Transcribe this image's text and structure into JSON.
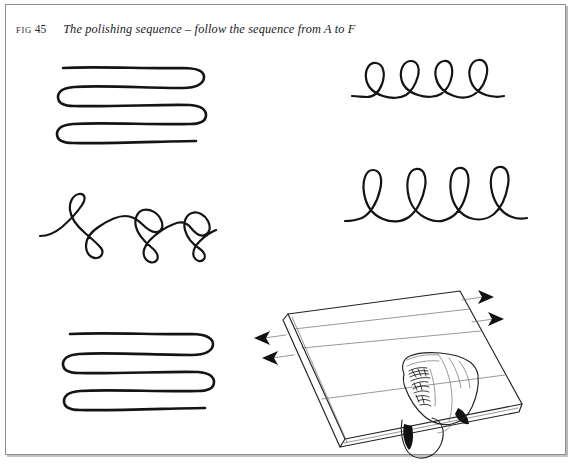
{
  "page": {
    "figure_number_prefix": "FIG",
    "figure_number": "45",
    "caption": "The polishing sequence – follow the sequence from A to F",
    "background_color": "#ffffff",
    "ink_color": "#141414",
    "frame_color": "#8e8e8e"
  },
  "figure": {
    "title": "The polishing sequence",
    "instruction": "follow the sequence from A to F",
    "sequence_start_label": "A",
    "sequence_end_label": "F",
    "panel_count": 6,
    "panels": [
      {
        "id": "A",
        "name": "serpentine-stroke-top-left",
        "pattern": "serpentine",
        "description": "Horizontal back-and-forth serpentine stroke with rounded U-turns",
        "rows": 4,
        "position": "top-left"
      },
      {
        "id": "B",
        "name": "small-loop-stroke-top-right",
        "pattern": "loops",
        "description": "Row of small overlapping loops riding on a horizontal baseline",
        "loop_count": 4,
        "position": "top-right"
      },
      {
        "id": "C",
        "name": "figure-eight-stroke-middle-left",
        "pattern": "figure-eight",
        "description": "Alternating loops above and below a wavy line forming figure eights",
        "loop_count": 6,
        "position": "middle-left"
      },
      {
        "id": "D",
        "name": "tall-loop-stroke-middle-right",
        "pattern": "loops",
        "description": "Row of tall narrow loops riding on a horizontal baseline",
        "loop_count": 5,
        "position": "middle-right"
      },
      {
        "id": "E",
        "name": "serpentine-stroke-bottom-left",
        "pattern": "serpentine",
        "description": "Horizontal back-and-forth serpentine stroke with rounded U-turns",
        "rows": 4,
        "position": "bottom-left"
      },
      {
        "id": "F",
        "name": "hand-polishing-board-illustration",
        "pattern": "illustration",
        "description": "Hand with cloth polishing a flat board shown in perspective, with direction arrows at both edges",
        "position": "bottom-right",
        "arrows_left": 2,
        "arrows_right": 2,
        "surface_guide_lines": 2
      }
    ]
  }
}
